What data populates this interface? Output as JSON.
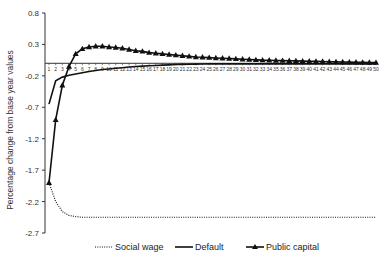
{
  "chart_data": {
    "type": "line",
    "title": "",
    "xlabel": "",
    "ylabel": "Percentage change from base year values",
    "ylim": [
      -2.7,
      0.8
    ],
    "yticks": [
      0.8,
      0.3,
      -0.2,
      -0.7,
      -1.2,
      -1.7,
      -2.2,
      -2.7
    ],
    "ytick_labels": [
      "0.8",
      "0.3",
      "-0.2",
      "-0.7",
      "-1.2",
      "-1.7",
      "-2.2",
      "-2.7"
    ],
    "x": [
      1,
      2,
      3,
      4,
      5,
      6,
      7,
      8,
      9,
      10,
      11,
      12,
      13,
      14,
      15,
      16,
      17,
      18,
      19,
      20,
      21,
      22,
      23,
      24,
      25,
      26,
      27,
      28,
      29,
      30,
      31,
      32,
      33,
      34,
      35,
      36,
      37,
      38,
      39,
      40,
      41,
      42,
      43,
      44,
      45,
      46,
      47,
      48,
      49,
      50
    ],
    "x_axis_at": 0,
    "grid": false,
    "legend_position": "bottom",
    "series": [
      {
        "name": "Social wage",
        "style": "dotted",
        "marker": "none",
        "values": [
          -1.9,
          -2.2,
          -2.36,
          -2.42,
          -2.44,
          -2.45,
          -2.45,
          -2.45,
          -2.45,
          -2.45,
          -2.45,
          -2.45,
          -2.45,
          -2.45,
          -2.45,
          -2.45,
          -2.45,
          -2.45,
          -2.45,
          -2.45,
          -2.45,
          -2.45,
          -2.45,
          -2.45,
          -2.45,
          -2.45,
          -2.45,
          -2.45,
          -2.45,
          -2.45,
          -2.45,
          -2.45,
          -2.45,
          -2.45,
          -2.45,
          -2.45,
          -2.45,
          -2.45,
          -2.45,
          -2.45,
          -2.45,
          -2.45,
          -2.45,
          -2.45,
          -2.45,
          -2.45,
          -2.45,
          -2.45,
          -2.45,
          -2.45
        ]
      },
      {
        "name": "Default",
        "style": "solid",
        "marker": "none",
        "values": [
          -0.65,
          -0.28,
          -0.22,
          -0.19,
          -0.17,
          -0.15,
          -0.13,
          -0.115,
          -0.1,
          -0.09,
          -0.08,
          -0.07,
          -0.06,
          -0.05,
          -0.045,
          -0.04,
          -0.035,
          -0.03,
          -0.025,
          -0.02,
          -0.018,
          -0.016,
          -0.014,
          -0.012,
          -0.01,
          -0.01,
          -0.01,
          -0.01,
          -0.01,
          -0.01,
          -0.01,
          -0.01,
          -0.01,
          -0.01,
          -0.01,
          -0.01,
          -0.01,
          -0.01,
          -0.01,
          -0.01,
          -0.01,
          -0.01,
          -0.01,
          -0.01,
          -0.01,
          -0.01,
          -0.01,
          -0.01,
          -0.01,
          -0.01
        ]
      },
      {
        "name": "Public capital",
        "style": "solid",
        "marker": "triangle",
        "values": [
          -1.9,
          -0.9,
          -0.35,
          -0.05,
          0.15,
          0.23,
          0.26,
          0.27,
          0.27,
          0.26,
          0.25,
          0.24,
          0.22,
          0.2,
          0.19,
          0.17,
          0.16,
          0.15,
          0.14,
          0.13,
          0.12,
          0.11,
          0.1,
          0.095,
          0.09,
          0.085,
          0.08,
          0.075,
          0.07,
          0.065,
          0.06,
          0.055,
          0.05,
          0.048,
          0.045,
          0.042,
          0.04,
          0.038,
          0.035,
          0.032,
          0.03,
          0.028,
          0.025,
          0.022,
          0.02,
          0.018,
          0.016,
          0.014,
          0.012,
          0.01
        ]
      }
    ]
  }
}
